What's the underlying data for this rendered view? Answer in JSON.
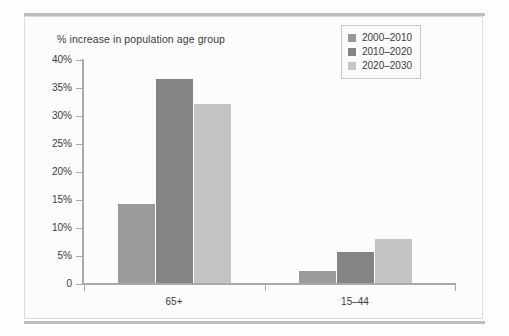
{
  "chart_data": {
    "type": "bar",
    "title": "% increase in population age group",
    "xlabel": "",
    "ylabel": "",
    "categories": [
      "65+",
      "15–44"
    ],
    "series": [
      {
        "name": "2000–2010",
        "color": "#9a9a9a",
        "values": [
          14.3,
          2.3
        ]
      },
      {
        "name": "2010–2020",
        "color": "#848484",
        "values": [
          36.6,
          5.7
        ]
      },
      {
        "name": "2020–2030",
        "color": "#c3c3c3",
        "values": [
          32.1,
          8.1
        ]
      }
    ],
    "ylim": [
      0,
      40
    ],
    "ytick_values": [
      0,
      5,
      10,
      15,
      20,
      25,
      30,
      35,
      40
    ],
    "ytick_labels": [
      "0",
      "5%",
      "10%",
      "15%",
      "20%",
      "25%",
      "30%",
      "35%",
      "40%"
    ],
    "grid": false,
    "legend_position": "top-right"
  },
  "axis": {
    "y_labels": [
      "40%",
      "35%",
      "30%",
      "25%",
      "20%",
      "15%",
      "10%",
      "5%",
      "0"
    ],
    "x_labels": [
      "65+",
      "15–44"
    ]
  },
  "legend": {
    "entries": [
      {
        "label": "2000–2010",
        "color": "#9a9a9a"
      },
      {
        "label": "2010–2020",
        "color": "#848484"
      },
      {
        "label": "2020–2030",
        "color": "#c3c3c3"
      }
    ]
  },
  "colors": {
    "axis": "#a9a9a9",
    "text": "#3b3b3b",
    "rule": "#bdbdbd",
    "frame": "#dcdcdc",
    "background": "#fcfcfc"
  }
}
